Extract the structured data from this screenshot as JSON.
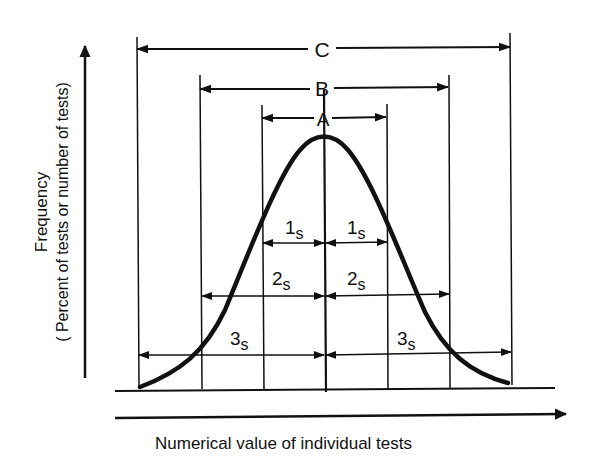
{
  "diagram": {
    "type": "normal-distribution-spread",
    "y_axis": {
      "label_line1": "Frequency",
      "label_line2": "( Percent of tests or number of tests)"
    },
    "x_axis": {
      "label": "Numerical value of individual tests"
    },
    "ranges": [
      {
        "name": "A",
        "label": "A",
        "span": "±1s"
      },
      {
        "name": "B",
        "label": "B",
        "span": "±2s"
      },
      {
        "name": "C",
        "label": "C",
        "span": "±3s"
      }
    ],
    "deviation_labels": {
      "one_s": {
        "num": "1",
        "sub": "s"
      },
      "two_s": {
        "num": "2",
        "sub": "s"
      },
      "three_s": {
        "num": "3",
        "sub": "s"
      }
    },
    "colors": {
      "ink": "#111111",
      "background": "#ffffff"
    }
  }
}
